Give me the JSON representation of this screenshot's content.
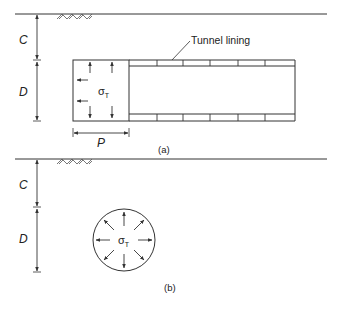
{
  "figure_a": {
    "caption": "(a)",
    "label_C": "C",
    "label_D": "D",
    "label_P": "P",
    "sigma_symbol": "σ",
    "sigma_subscript": "T",
    "lining_label": "Tunnel lining"
  },
  "figure_b": {
    "caption": "(b)",
    "label_C": "C",
    "label_D": "D",
    "sigma_symbol": "σ",
    "sigma_subscript": "T"
  },
  "colors": {
    "line": "#333333",
    "background": "#ffffff"
  }
}
